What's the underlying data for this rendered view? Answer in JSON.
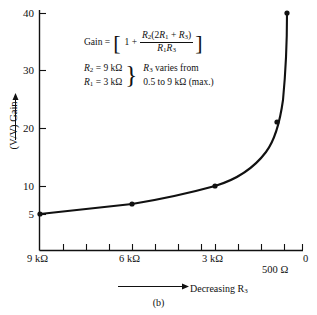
{
  "chart_data": {
    "type": "line",
    "title": "",
    "xlabel": "Decreasing R3",
    "ylabel": "(V/V) Gain",
    "x_tick_labels": [
      "9 kΩ",
      "6 kΩ",
      "3 kΩ",
      "500 Ω",
      "0"
    ],
    "x_tick_label_positions": [
      40,
      132,
      215,
      282,
      302
    ],
    "x_minor_ticks": [
      40,
      63,
      86,
      109,
      132,
      155,
      178,
      201,
      215,
      238,
      261,
      284,
      302
    ],
    "y_ticks": [
      5,
      10,
      20,
      30,
      40
    ],
    "ylim": [
      0,
      43
    ],
    "xlim_note": "R3 decreasing from 9 kΩ at left to 0 at right",
    "grid": false,
    "legend": false,
    "points": [
      {
        "r3": "9 kΩ",
        "gain": 5.0,
        "px": 40,
        "py": 214
      },
      {
        "r3": "6 kΩ",
        "gain": 6.8,
        "px": 132,
        "py": 204
      },
      {
        "r3": "3 kΩ",
        "gain": 10.0,
        "px": 215,
        "py": 186
      },
      {
        "r3": "1 kΩ",
        "gain": 22.0,
        "px": 277,
        "py": 122
      },
      {
        "r3": "500 Ω",
        "gain": 40.0,
        "px": 287,
        "py": 13
      }
    ],
    "curve_path": "M40,214 L132,204 Q175,197 215,186 Q248,176 266,152 Q278,136 283,100 Q287,58 287,14"
  },
  "annotation": {
    "gain_label": "Gain =",
    "one_plus": "1 +",
    "numerator_pre": "R",
    "numerator": "R2(2R1 + R3)",
    "denominator": "R1R3",
    "num_r2": "R",
    "num_r2_sub": "2",
    "num_open": "(2",
    "num_r1": "R",
    "num_r1_sub": "1",
    "num_plus": " + ",
    "num_r3": "R",
    "num_r3_sub": "3",
    "num_close": ")",
    "den_r1": "R",
    "den_r1_sub": "1",
    "den_r3": "R",
    "den_r3_sub": "3",
    "bracket_open": "[",
    "bracket_close": "]",
    "cond_r2": "R",
    "cond_r2_sub": "2",
    "cond_r2_val": " = 9 kΩ",
    "cond_r1": "R",
    "cond_r1_sub": "1",
    "cond_r1_val": " = 3 kΩ",
    "brace": "}",
    "varies_r3": "R",
    "varies_r3_sub": "3",
    "varies_text": " varies from",
    "range_text": "0.5 to 9 kΩ (max.)"
  },
  "axes": {
    "y_tick_5": "5",
    "y_tick_10": "10",
    "y_tick_20": "20",
    "y_tick_30": "30",
    "y_tick_40": "40",
    "x_tick_9k": "9 kΩ",
    "x_tick_6k": "6 kΩ",
    "x_tick_3k": "3 kΩ",
    "x_tick_500": "500 Ω",
    "x_tick_0": "0",
    "ylabel_text": "(V/V) Gain",
    "xlabel_text": "Decreasing R",
    "xlabel_sub": "3"
  },
  "caption": {
    "text": "(b)"
  },
  "colors": {
    "ink": "#111111",
    "background": "#ffffff"
  }
}
